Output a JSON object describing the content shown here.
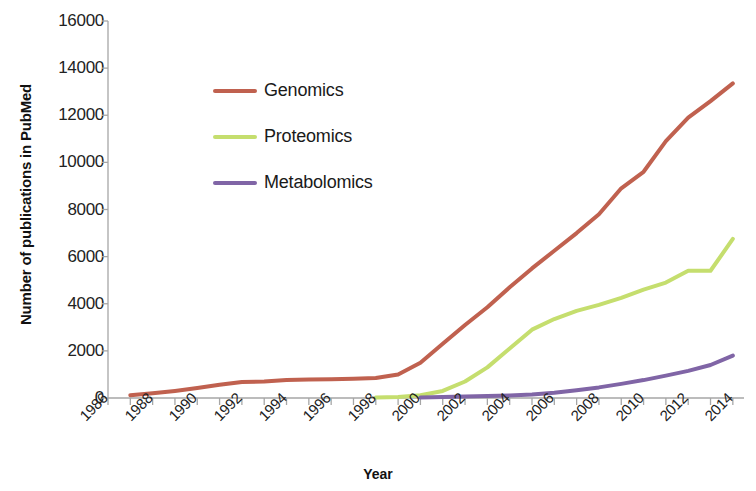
{
  "chart_data": {
    "type": "line",
    "title": "",
    "xlabel": "Year",
    "ylabel": "Number of publications in PubMed",
    "x": [
      1986,
      1987,
      1988,
      1989,
      1990,
      1991,
      1992,
      1993,
      1994,
      1995,
      1996,
      1997,
      1998,
      1999,
      2000,
      2001,
      2002,
      2003,
      2004,
      2005,
      2006,
      2007,
      2008,
      2009,
      2010,
      2011,
      2012,
      2013,
      2014
    ],
    "xlim": [
      1986,
      2014.5
    ],
    "ylim": [
      0,
      16000
    ],
    "ytick_values": [
      0,
      2000,
      4000,
      6000,
      8000,
      10000,
      12000,
      14000,
      16000
    ],
    "ytick_labels": [
      "0",
      "2000",
      "4000",
      "6000",
      "8000",
      "10000",
      "12000",
      "14000",
      "16000"
    ],
    "xtick_labels": [
      "1986",
      "1988",
      "1990",
      "1992",
      "1994",
      "1996",
      "1998",
      "2000",
      "2002",
      "2004",
      "2006",
      "2008",
      "2010",
      "2012",
      "2014"
    ],
    "xtick_label_values": [
      1986,
      1988,
      1990,
      1992,
      1994,
      1996,
      1998,
      2000,
      2002,
      2004,
      2006,
      2008,
      2010,
      2012,
      2014
    ],
    "grid": false,
    "legend_position": "upper-left-inside",
    "series": [
      {
        "name": "Genomics",
        "color": "#C0614F",
        "x": [
          1987,
          1988,
          1989,
          1990,
          1991,
          1992,
          1993,
          1994,
          1995,
          1996,
          1997,
          1998,
          1999,
          2000,
          2001,
          2002,
          2003,
          2004,
          2005,
          2006,
          2007,
          2008,
          2009,
          2010,
          2011,
          2012,
          2013,
          2014
        ],
        "values": [
          120,
          200,
          300,
          420,
          560,
          680,
          700,
          760,
          790,
          800,
          820,
          850,
          1000,
          1500,
          2300,
          3100,
          3850,
          4700,
          5500,
          6250,
          7000,
          7800,
          8900,
          9600,
          10900,
          11900,
          12600,
          13350
        ]
      },
      {
        "name": "Proteomics",
        "color": "#C5DE6E",
        "x": [
          1998,
          1999,
          2000,
          2001,
          2002,
          2003,
          2004,
          2005,
          2006,
          2007,
          2008,
          2009,
          2010,
          2011,
          2012,
          2013,
          2014
        ],
        "values": [
          20,
          40,
          120,
          300,
          700,
          1300,
          2100,
          2900,
          3350,
          3700,
          3950,
          4250,
          4600,
          4900,
          5400,
          5400,
          6750
        ]
      },
      {
        "name": "Metabolomics",
        "color": "#8065A6",
        "x": [
          2000,
          2001,
          2002,
          2003,
          2004,
          2005,
          2006,
          2007,
          2008,
          2009,
          2010,
          2011,
          2012,
          2013,
          2014
        ],
        "values": [
          20,
          40,
          60,
          80,
          110,
          150,
          220,
          330,
          450,
          600,
          760,
          950,
          1150,
          1400,
          1800
        ]
      }
    ]
  },
  "legend": {
    "items": [
      {
        "label": "Genomics",
        "color": "#C0614F"
      },
      {
        "label": "Proteomics",
        "color": "#C5DE6E"
      },
      {
        "label": "Metabolomics",
        "color": "#8065A6"
      }
    ]
  },
  "axes": {
    "x_title": "Year",
    "y_title": "Number of publications in PubMed"
  }
}
